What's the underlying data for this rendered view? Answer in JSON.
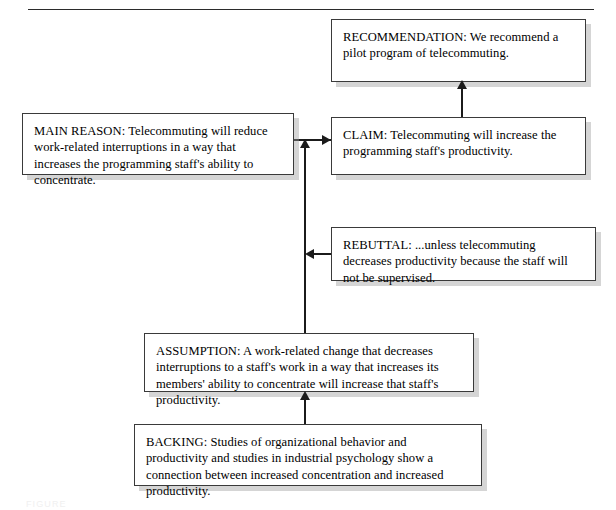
{
  "diagram": {
    "type": "toulmin-argument-model",
    "top_rule": true,
    "caption": "FIGURE",
    "nodes": [
      {
        "id": "recommendation",
        "label": "RECOMMENDATION",
        "text": "RECOMMENDATION: We recommend a pilot program of telecommuting."
      },
      {
        "id": "claim",
        "label": "CLAIM",
        "text": "CLAIM: Telecommuting will increase the programming staff's productivity."
      },
      {
        "id": "main_reason",
        "label": "MAIN REASON",
        "text": "MAIN REASON: Telecommuting will reduce work-related interruptions in a way that increases the programming staff's ability to concentrate."
      },
      {
        "id": "rebuttal",
        "label": "REBUTTAL",
        "text": "REBUTTAL: ...unless telecommuting decreases productivity because the staff will not be supervised."
      },
      {
        "id": "assumption",
        "label": "ASSUMPTION",
        "text": "ASSUMPTION: A work-related change that decreases interruptions to a staff's work in a way that increases its members' ability to concentrate will increase that staff's productivity."
      },
      {
        "id": "backing",
        "label": "BACKING",
        "text": "BACKING: Studies of organizational behavior and productivity and studies in industrial psychology show a connection between increased concentration and increased productivity."
      }
    ],
    "connectors": [
      {
        "from": "claim",
        "to": "recommendation",
        "direction": "up"
      },
      {
        "from": "main_reason",
        "to": "claim",
        "direction": "right"
      },
      {
        "from": "assumption",
        "to": "claim",
        "direction": "up"
      },
      {
        "from": "rebuttal",
        "to": "assumption-spine",
        "direction": "left"
      },
      {
        "from": "backing",
        "to": "assumption",
        "direction": "up"
      }
    ],
    "colors": {
      "box_border": "#3a3a3a",
      "box_fill": "#ffffff",
      "text": "#000000",
      "connector": "#1b1b1b",
      "shadow": "#9b9b9b",
      "rule": "#2b2b2b"
    }
  }
}
